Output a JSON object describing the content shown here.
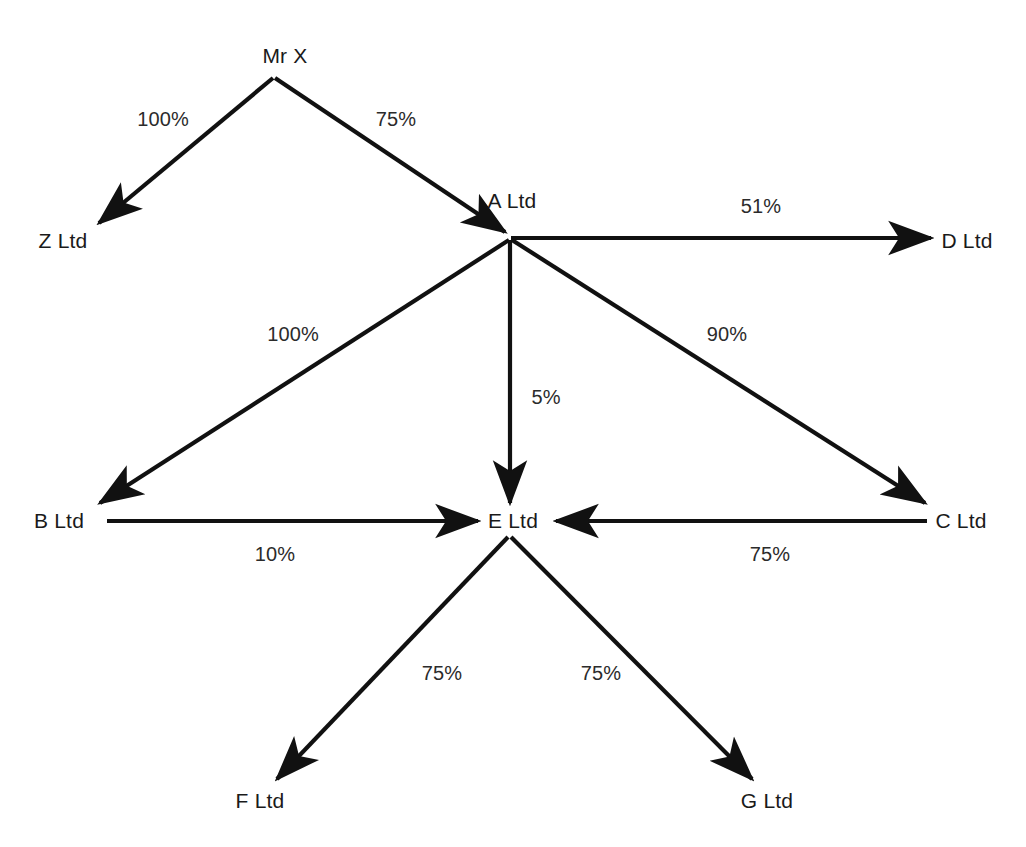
{
  "diagram": {
    "type": "ownership-structure-graph",
    "background_color": "#ffffff",
    "line_color": "#111111",
    "text_color": "#1a1a1a",
    "nodes": [
      {
        "id": "mrx",
        "label": "Mr X",
        "x": 285,
        "y": 55,
        "anchor": "center"
      },
      {
        "id": "z",
        "label": "Z Ltd",
        "x": 63,
        "y": 240,
        "anchor": "center"
      },
      {
        "id": "a",
        "label": "A Ltd",
        "x": 512,
        "y": 200,
        "anchor": "center"
      },
      {
        "id": "d",
        "label": "D Ltd",
        "x": 967,
        "y": 240,
        "anchor": "center"
      },
      {
        "id": "b",
        "label": "B Ltd",
        "x": 59,
        "y": 520,
        "anchor": "center"
      },
      {
        "id": "e",
        "label": "E Ltd",
        "x": 513,
        "y": 520,
        "anchor": "center"
      },
      {
        "id": "c",
        "label": "C Ltd",
        "x": 961,
        "y": 520,
        "anchor": "center"
      },
      {
        "id": "f",
        "label": "F Ltd",
        "x": 260,
        "y": 800,
        "anchor": "center"
      },
      {
        "id": "g",
        "label": "G Ltd",
        "x": 767,
        "y": 800,
        "anchor": "center"
      }
    ],
    "edges": [
      {
        "id": "mrx-z",
        "from": "mrx",
        "to": "z",
        "label": "100%",
        "label_x": 163,
        "label_y": 119
      },
      {
        "id": "mrx-a",
        "from": "mrx",
        "to": "a",
        "label": "75%",
        "label_x": 396,
        "label_y": 119
      },
      {
        "id": "a-d",
        "from": "a",
        "to": "d",
        "label": "51%",
        "label_x": 761,
        "label_y": 206
      },
      {
        "id": "a-b",
        "from": "a",
        "to": "b",
        "label": "100%",
        "label_x": 293,
        "label_y": 334
      },
      {
        "id": "a-e",
        "from": "a",
        "to": "e",
        "label": "5%",
        "label_x": 546,
        "label_y": 397
      },
      {
        "id": "a-c",
        "from": "a",
        "to": "c",
        "label": "90%",
        "label_x": 727,
        "label_y": 334
      },
      {
        "id": "b-e",
        "from": "b",
        "to": "e",
        "label": "10%",
        "label_x": 275,
        "label_y": 554
      },
      {
        "id": "c-e",
        "from": "c",
        "to": "e",
        "label": "75%",
        "label_x": 770,
        "label_y": 554
      },
      {
        "id": "e-f",
        "from": "e",
        "to": "f",
        "label": "75%",
        "label_x": 442,
        "label_y": 673
      },
      {
        "id": "e-g",
        "from": "e",
        "to": "g",
        "label": "75%",
        "label_x": 601,
        "label_y": 673
      }
    ]
  }
}
